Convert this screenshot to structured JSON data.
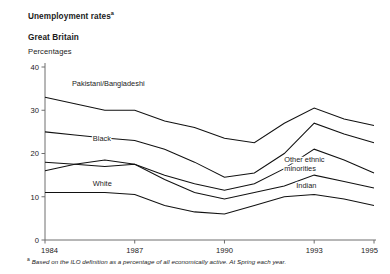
{
  "header": {
    "title": "Unemployment rates",
    "title_superscript": "a",
    "region": "Great Britain",
    "units": "Percentages"
  },
  "footnote": {
    "marker": "a",
    "text": "Based on the ILO definition as a percentage of all economically active. At Spring each year."
  },
  "chart_data": {
    "type": "line",
    "title": "Unemployment rates",
    "subtitle": "Great Britain",
    "xlabel": "",
    "ylabel": "Percentages",
    "ylim": [
      0,
      40
    ],
    "xlim": [
      1984,
      1995
    ],
    "yticks": [
      0,
      10,
      20,
      30,
      40
    ],
    "xticks": [
      1984,
      1987,
      1990,
      1993,
      1995
    ],
    "xtick_labels": [
      "1984",
      "1987",
      "1990",
      "1993",
      "1995"
    ],
    "ytick_labels": [
      "0",
      "10",
      "20",
      "30",
      "40"
    ],
    "grid": false,
    "legend": "inline-labels",
    "x": [
      1984,
      1985,
      1986,
      1987,
      1988,
      1989,
      1990,
      1991,
      1992,
      1993,
      1994,
      1995
    ],
    "series": [
      {
        "name": "Pakistani/Bangladeshi",
        "label": "Pakistani/Bangladeshi",
        "label_x": 1984.9,
        "label_y": 35.5,
        "values": [
          33.0,
          31.5,
          30.0,
          30.0,
          27.5,
          26.0,
          23.5,
          22.5,
          27.0,
          30.5,
          28.0,
          26.5
        ]
      },
      {
        "name": "Black",
        "label": "Black",
        "label_x": 1985.6,
        "label_y": 23.0,
        "values": [
          25.0,
          24.3,
          23.6,
          23.0,
          21.0,
          18.0,
          14.5,
          15.5,
          20.0,
          27.0,
          24.5,
          22.5
        ]
      },
      {
        "name": "Other ethnic minorities",
        "label": "Other ethnic minorities",
        "label_line1": "Other ethnic",
        "label_line2": "minorities",
        "label_x": 1992.0,
        "label_y": 18.0,
        "values": [
          16.0,
          17.5,
          18.5,
          17.5,
          15.0,
          13.0,
          11.5,
          13.0,
          16.5,
          21.0,
          18.5,
          15.5
        ]
      },
      {
        "name": "Indian",
        "label": "Indian",
        "label_x": 1992.4,
        "label_y": 12.0,
        "values": [
          18.0,
          17.5,
          17.0,
          17.5,
          14.0,
          11.0,
          9.5,
          11.0,
          12.5,
          15.0,
          13.5,
          12.0
        ]
      },
      {
        "name": "White",
        "label": "White",
        "label_x": 1985.6,
        "label_y": 12.5,
        "values": [
          11.0,
          11.0,
          11.0,
          10.5,
          8.0,
          6.5,
          6.0,
          8.0,
          10.0,
          10.5,
          9.5,
          8.0
        ]
      }
    ]
  }
}
